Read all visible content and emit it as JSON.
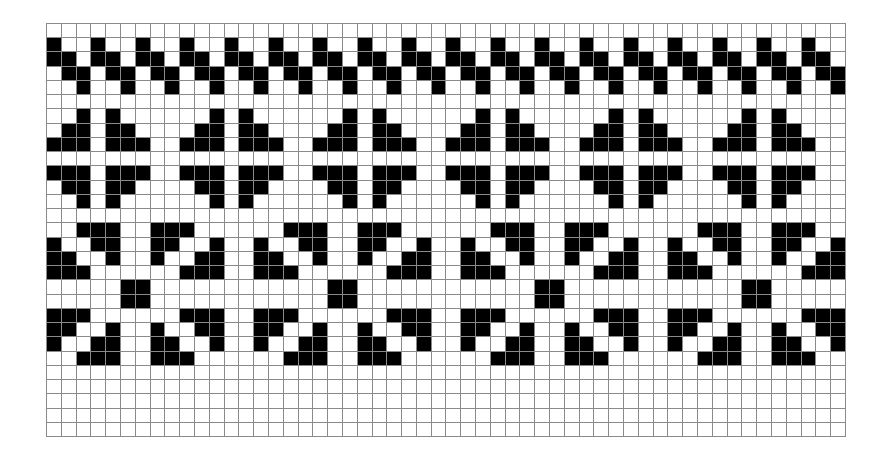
{
  "grid": {
    "columns": 54,
    "rows": 29,
    "colors": {
      "filled": "#000000",
      "empty": "#ffffff",
      "gridline": "#8a8a8a"
    },
    "bands": [
      {
        "name": "diagonal-zigzag",
        "start_row": 1,
        "period": 3,
        "motif": [
          "X..",
          "XX.",
          ".XX",
          "..X"
        ]
      },
      {
        "name": "four-triangle-cross",
        "start_row": 6,
        "period": 9,
        "motif": [
          "..X.X....",
          ".XX.XX...",
          "XXX.XXX..",
          ".........",
          "XXX.XXX..",
          ".XX.XX...",
          "..X.X...."
        ]
      },
      {
        "name": "pinwheel-blocks",
        "start_row": 14,
        "period": 14,
        "motif": [
          "..XXX..XXX....",
          "X..XX..XX..X..",
          "XX..X..X..XX..",
          "XXX......XXX..",
          ".....XX.......",
          ".....XX.......",
          "XXX......XXX..",
          "XX..X..X..XX..",
          "X..XX..XX..X..",
          "..XXX..XXX...."
        ]
      }
    ]
  }
}
